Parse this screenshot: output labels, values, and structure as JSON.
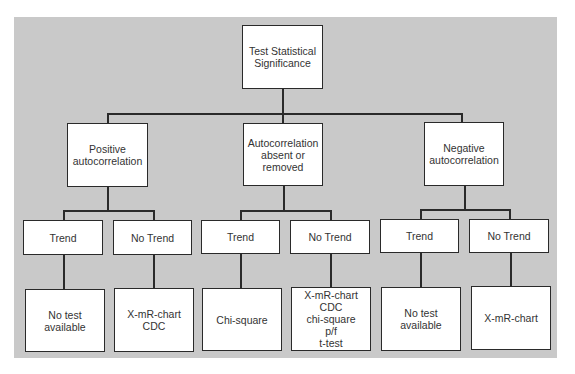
{
  "root": {
    "label": "Test Statistical\nSignificance"
  },
  "branches": [
    {
      "label": "Positive\nautocorrelation",
      "children": [
        {
          "label": "Trend",
          "result": "No test\navailable"
        },
        {
          "label": "No Trend",
          "result": "X-mR-chart\nCDC"
        }
      ]
    },
    {
      "label": "Autocorrelation\nabsent or\nremoved",
      "children": [
        {
          "label": "Trend",
          "result": "Chi-square"
        },
        {
          "label": "No Trend",
          "result": "X-mR-chart\nCDC\nchi-square\np/f\nt-test"
        }
      ]
    },
    {
      "label": "Negative\nautocorrelation",
      "children": [
        {
          "label": "Trend",
          "result": "No test\navailable"
        },
        {
          "label": "No Trend",
          "result": "X-mR-chart"
        }
      ]
    }
  ]
}
